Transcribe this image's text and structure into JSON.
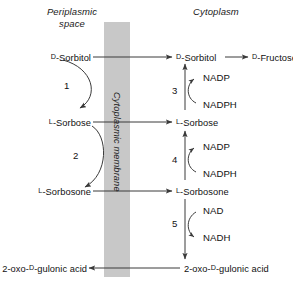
{
  "figure": {
    "type": "pathway-diagram",
    "title_left": "Periplasmic space",
    "title_right": "Cytoplasm",
    "membrane_label": "Cytoplasmic membrane",
    "membrane_color": "#c8c8c8",
    "line_color": "#3a3a3a",
    "text_color": "#111111"
  },
  "compartments": {
    "periplasm": {
      "header_line1": "Periplasmic",
      "header_line2": "space",
      "metabolites": [
        {
          "id": "peri-sorbitol",
          "prefix": "D",
          "name": "-Sorbitol",
          "y": 57
        },
        {
          "id": "peri-sorbose",
          "prefix": "L",
          "name": "-Sorbose",
          "y": 122
        },
        {
          "id": "peri-sorbosone",
          "prefix": "L",
          "name": "-Sorbosone",
          "y": 191
        },
        {
          "id": "peri-gulonic",
          "prefix": "",
          "name": "2-oxo-D-gulonic acid",
          "y": 268
        }
      ]
    },
    "cytoplasm": {
      "header": "Cytoplasm",
      "metabolites": [
        {
          "id": "cyto-sorbitol",
          "prefix": "D",
          "name": "-Sorbitol",
          "y": 57
        },
        {
          "id": "cyto-fructose",
          "prefix": "D",
          "name": "-Fructose",
          "y": 57
        },
        {
          "id": "cyto-sorbose",
          "prefix": "L",
          "name": "-Sorbose",
          "y": 122
        },
        {
          "id": "cyto-sorbosone",
          "prefix": "L",
          "name": "-Sorbosone",
          "y": 191
        },
        {
          "id": "cyto-gulonic",
          "prefix": "",
          "name": "2-oxo-D-gulonic acid",
          "y": 268
        }
      ]
    }
  },
  "reactions": [
    {
      "number": "1",
      "side": "periplasm",
      "from": "D-Sorbitol",
      "to": "L-Sorbose",
      "cofactor_in": "",
      "cofactor_out": ""
    },
    {
      "number": "2",
      "side": "periplasm",
      "from": "L-Sorbose",
      "to": "L-Sorbosone",
      "cofactor_in": "",
      "cofactor_out": ""
    },
    {
      "number": "3",
      "side": "cytoplasm",
      "from": "L-Sorbose",
      "to": "D-Sorbitol",
      "cofactor_in": "NADPH",
      "cofactor_out": "NADP"
    },
    {
      "number": "4",
      "side": "cytoplasm",
      "from": "L-Sorbosone",
      "to": "L-Sorbose",
      "cofactor_in": "NADPH",
      "cofactor_out": "NADP"
    },
    {
      "number": "5",
      "side": "cytoplasm",
      "from": "L-Sorbosone",
      "to": "2-oxo-D-gulonic acid",
      "cofactor_in": "NAD",
      "cofactor_out": "NADH"
    }
  ],
  "labels": {
    "peri_sorbitol_prefix": "D",
    "peri_sorbitol": "-Sorbitol",
    "peri_sorbose_prefix": "L",
    "peri_sorbose": "-Sorbose",
    "peri_sorbosone_prefix": "L",
    "peri_sorbosone": "-Sorbosone",
    "peri_gulonic_a": "2-oxo-",
    "peri_gulonic_prefix": "D",
    "peri_gulonic_b": "-gulonic acid",
    "cyto_sorbitol_prefix": "D",
    "cyto_sorbitol": "-Sorbitol",
    "cyto_fructose_prefix": "D",
    "cyto_fructose": "-Fructose",
    "cyto_sorbose_prefix": "L",
    "cyto_sorbose": "-Sorbose",
    "cyto_sorbosone_prefix": "L",
    "cyto_sorbosone": "-Sorbosone",
    "cyto_gulonic_a": "2-oxo-",
    "cyto_gulonic_prefix": "D",
    "cyto_gulonic_b": "-gulonic acid",
    "nadp_3": "NADP",
    "nadph_3": "NADPH",
    "nadp_4": "NADP",
    "nadph_4": "NADPH",
    "nad_5": "NAD",
    "nadh_5": "NADH",
    "num1": "1",
    "num2": "2",
    "num3": "3",
    "num4": "4",
    "num5": "5",
    "membrane": "Cytoplasmic membrane",
    "hdr_peri_1": "Periplasmic",
    "hdr_peri_2": "space",
    "hdr_cyto": "Cytoplasm"
  }
}
